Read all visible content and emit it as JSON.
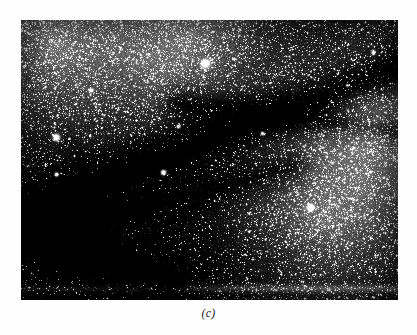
{
  "figure": {
    "caption": "(c)",
    "kind": "astronomical-photograph",
    "palette": {
      "page_background": "#ffffff",
      "plate_darkest": "#060606",
      "plate_mid": "#3a3a3a",
      "plate_bright": "#d8d8d8",
      "star_core": "#ffffff",
      "caption_color": "#1a1a1a"
    },
    "plate_geometry": {
      "left": 21,
      "top": 20,
      "width": 377,
      "height": 280
    },
    "image_data": {
      "type": "grayscale-starfield",
      "background_gradients": [
        {
          "name": "upper-left-glow",
          "cx": 0.1,
          "cy": 0.08,
          "radius": 0.55,
          "level": 0.4
        },
        {
          "name": "upper-mid-glow",
          "cx": 0.45,
          "cy": 0.05,
          "radius": 0.45,
          "level": 0.34
        },
        {
          "name": "right-glow",
          "cx": 0.93,
          "cy": 0.38,
          "radius": 0.5,
          "level": 0.38
        },
        {
          "name": "lower-right-glow",
          "cx": 0.8,
          "cy": 0.72,
          "radius": 0.45,
          "level": 0.3
        },
        {
          "name": "lower-left-dark",
          "cx": 0.08,
          "cy": 0.82,
          "radius": 0.55,
          "level": -0.22
        },
        {
          "name": "bottom-mid-dark",
          "cx": 0.4,
          "cy": 0.95,
          "radius": 0.4,
          "level": -0.14
        }
      ],
      "dust_lanes": [
        {
          "name": "main-diagonal-lane",
          "x1": 1.02,
          "y1": 0.16,
          "x2": -0.04,
          "y2": 0.7,
          "width": 0.115,
          "strength": 0.36
        },
        {
          "name": "upper-right-lane",
          "x1": 1.04,
          "y1": 0.4,
          "x2": 0.42,
          "y2": 0.3,
          "width": 0.085,
          "strength": 0.24
        },
        {
          "name": "lower-sweep-lane",
          "x1": 0.72,
          "y1": 0.52,
          "x2": 0.02,
          "y2": 0.78,
          "width": 0.095,
          "strength": 0.2
        },
        {
          "name": "bottom-left-lane",
          "x1": 0.38,
          "y1": 0.92,
          "x2": -0.05,
          "y2": 0.74,
          "width": 0.1,
          "strength": 0.18
        }
      ],
      "bright_stars": [
        {
          "name": "star-top-center",
          "x": 0.489,
          "y": 0.154,
          "radius": 4.2,
          "intensity": 1.0
        },
        {
          "name": "star-left-mid",
          "x": 0.093,
          "y": 0.421,
          "radius": 3.6,
          "intensity": 0.94
        },
        {
          "name": "star-center-low",
          "x": 0.377,
          "y": 0.543,
          "radius": 3.4,
          "intensity": 0.96
        },
        {
          "name": "star-right-low",
          "x": 0.767,
          "y": 0.671,
          "radius": 3.6,
          "intensity": 0.92
        },
        {
          "name": "star-left-lower",
          "x": 0.093,
          "y": 0.55,
          "radius": 2.6,
          "intensity": 0.8
        },
        {
          "name": "star-mid-right",
          "x": 0.64,
          "y": 0.404,
          "radius": 2.4,
          "intensity": 0.78
        },
        {
          "name": "star-center-upper",
          "x": 0.419,
          "y": 0.379,
          "radius": 2.2,
          "intensity": 0.76
        },
        {
          "name": "star-upper-left",
          "x": 0.188,
          "y": 0.25,
          "radius": 2.2,
          "intensity": 0.74
        },
        {
          "name": "star-far-right",
          "x": 0.936,
          "y": 0.115,
          "radius": 2.3,
          "intensity": 0.76
        },
        {
          "name": "star-right-upper",
          "x": 0.866,
          "y": 0.233,
          "radius": 2.0,
          "intensity": 0.7
        }
      ],
      "bottom_streak": {
        "y": 0.958,
        "height": 0.022,
        "brightness": 0.22
      },
      "star_count": 26000,
      "grain_amount": 0.13
    }
  }
}
